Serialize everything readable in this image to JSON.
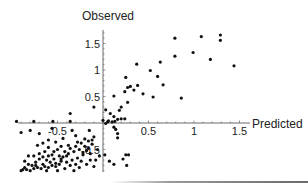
{
  "chart_data": {
    "type": "scatter",
    "title": "",
    "xlabel": "Predicted",
    "ylabel": "Observed",
    "xlim": [
      -0.95,
      1.6
    ],
    "ylim": [
      -0.95,
      1.75
    ],
    "grid": false,
    "legend": null,
    "x_ticks": [
      -0.5,
      0.5,
      1,
      1.5
    ],
    "y_ticks": [
      -0.5,
      0.5,
      1,
      1.5
    ],
    "x_tick_labels": [
      "-0.5",
      "0.5",
      "1",
      "1.5"
    ],
    "y_tick_labels": [
      "-0.5",
      "0.5",
      "1",
      "1.5"
    ],
    "series": [
      {
        "name": "observations",
        "color": "#111111",
        "points": [
          [
            1.08,
            1.63
          ],
          [
            1.29,
            1.66
          ],
          [
            1.29,
            1.56
          ],
          [
            0.79,
            1.6
          ],
          [
            1.44,
            1.08
          ],
          [
            1.18,
            1.2
          ],
          [
            0.79,
            1.26
          ],
          [
            0.99,
            1.33
          ],
          [
            0.63,
            1.15
          ],
          [
            0.52,
            0.99
          ],
          [
            0.37,
            1.11
          ],
          [
            0.25,
            0.86
          ],
          [
            0.86,
            0.47
          ],
          [
            0.6,
            0.88
          ],
          [
            0.66,
            0.72
          ],
          [
            0.55,
            0.49
          ],
          [
            0.44,
            0.55
          ],
          [
            0.34,
            0.62
          ],
          [
            0.38,
            0.71
          ],
          [
            0.3,
            0.69
          ],
          [
            0.27,
            0.67
          ],
          [
            0.24,
            0.59
          ],
          [
            0.27,
            0.39
          ],
          [
            0.12,
            0.51
          ],
          [
            0.2,
            0.3
          ],
          [
            0.18,
            0.24
          ],
          [
            0.03,
            0.25
          ],
          [
            0.0,
            0.05
          ],
          [
            0.08,
            0.18
          ],
          [
            0.12,
            0.12
          ],
          [
            0.24,
            0.08
          ],
          [
            0.2,
            0.08
          ],
          [
            0.16,
            0.07
          ],
          [
            0.13,
            0.03
          ],
          [
            0.1,
            0.02
          ],
          [
            0.06,
            0.04
          ],
          [
            0.05,
            0.02
          ],
          [
            0.03,
            -0.01
          ],
          [
            0.14,
            -0.12
          ],
          [
            0.12,
            -0.08
          ],
          [
            0.16,
            -0.2
          ],
          [
            0.16,
            -0.28
          ],
          [
            0.02,
            -0.6
          ],
          [
            0.07,
            -0.72
          ],
          [
            0.12,
            -0.78
          ],
          [
            0.22,
            -0.68
          ],
          [
            0.25,
            -0.6
          ],
          [
            0.28,
            -0.6
          ],
          [
            0.26,
            -0.8
          ],
          [
            -0.1,
            0.3
          ],
          [
            -0.36,
            0.18
          ],
          [
            -0.95,
            0.03
          ],
          [
            -0.76,
            0.03
          ],
          [
            -0.55,
            0.03
          ],
          [
            -0.36,
            0.03
          ],
          [
            -0.9,
            -0.18
          ],
          [
            -0.8,
            -0.14
          ],
          [
            -0.7,
            -0.2
          ],
          [
            -0.56,
            -0.1
          ],
          [
            -0.34,
            -0.14
          ],
          [
            -0.15,
            -0.14
          ],
          [
            -0.3,
            -0.24
          ],
          [
            -0.44,
            -0.29
          ],
          [
            -0.52,
            -0.36
          ],
          [
            -0.6,
            -0.32
          ],
          [
            -0.66,
            -0.38
          ],
          [
            -0.72,
            -0.42
          ],
          [
            -0.6,
            -0.46
          ],
          [
            -0.5,
            -0.5
          ],
          [
            -0.42,
            -0.54
          ],
          [
            -0.36,
            -0.48
          ],
          [
            -0.3,
            -0.44
          ],
          [
            -0.24,
            -0.38
          ],
          [
            -0.2,
            -0.3
          ],
          [
            -0.16,
            -0.34
          ],
          [
            -0.12,
            -0.4
          ],
          [
            -0.1,
            -0.26
          ],
          [
            -0.06,
            -0.5
          ],
          [
            -0.14,
            -0.58
          ],
          [
            -0.22,
            -0.6
          ],
          [
            -0.28,
            -0.66
          ],
          [
            -0.34,
            -0.7
          ],
          [
            -0.4,
            -0.74
          ],
          [
            -0.46,
            -0.72
          ],
          [
            -0.52,
            -0.76
          ],
          [
            -0.58,
            -0.74
          ],
          [
            -0.62,
            -0.7
          ],
          [
            -0.66,
            -0.78
          ],
          [
            -0.7,
            -0.68
          ],
          [
            -0.74,
            -0.74
          ],
          [
            -0.78,
            -0.8
          ],
          [
            -0.82,
            -0.78
          ],
          [
            -0.86,
            -0.84
          ],
          [
            -0.88,
            -0.88
          ],
          [
            -0.84,
            -0.88
          ],
          [
            -0.8,
            -0.9
          ],
          [
            -0.76,
            -0.86
          ],
          [
            -0.72,
            -0.84
          ],
          [
            -0.68,
            -0.86
          ],
          [
            -0.64,
            -0.82
          ],
          [
            -0.6,
            -0.84
          ],
          [
            -0.56,
            -0.8
          ],
          [
            -0.52,
            -0.82
          ],
          [
            -0.48,
            -0.78
          ],
          [
            -0.44,
            -0.64
          ],
          [
            -0.38,
            -0.58
          ],
          [
            -0.32,
            -0.54
          ],
          [
            -0.26,
            -0.5
          ],
          [
            -0.2,
            -0.44
          ],
          [
            -0.18,
            -0.52
          ],
          [
            -0.24,
            -0.72
          ],
          [
            -0.3,
            -0.78
          ],
          [
            -0.08,
            -0.7
          ],
          [
            -0.04,
            -0.62
          ],
          [
            -0.7,
            -0.58
          ],
          [
            -0.76,
            -0.62
          ],
          [
            -0.64,
            -0.54
          ],
          [
            -0.56,
            -0.6
          ],
          [
            -0.48,
            -0.62
          ],
          [
            -0.4,
            -0.62
          ],
          [
            -0.36,
            -0.8
          ],
          [
            -0.14,
            -0.7
          ],
          [
            -0.1,
            -0.82
          ],
          [
            -0.18,
            -0.78
          ],
          [
            -0.26,
            -0.84
          ],
          [
            -0.42,
            -0.86
          ],
          [
            -0.62,
            -0.9
          ],
          [
            -0.9,
            -0.9
          ],
          [
            -0.82,
            -0.62
          ],
          [
            -0.66,
            -0.64
          ],
          [
            -0.54,
            -0.68
          ],
          [
            -0.46,
            -0.68
          ],
          [
            -0.22,
            -0.56
          ],
          [
            -0.16,
            -0.48
          ],
          [
            -0.12,
            -0.32
          ],
          [
            -0.28,
            -0.36
          ],
          [
            -0.38,
            -0.42
          ],
          [
            -0.46,
            -0.44
          ],
          [
            -0.54,
            -0.54
          ],
          [
            -0.6,
            -0.62
          ],
          [
            -0.86,
            -0.72
          ],
          [
            -0.74,
            -0.8
          ],
          [
            -0.5,
            -0.9
          ],
          [
            -0.32,
            -0.9
          ]
        ]
      }
    ]
  }
}
